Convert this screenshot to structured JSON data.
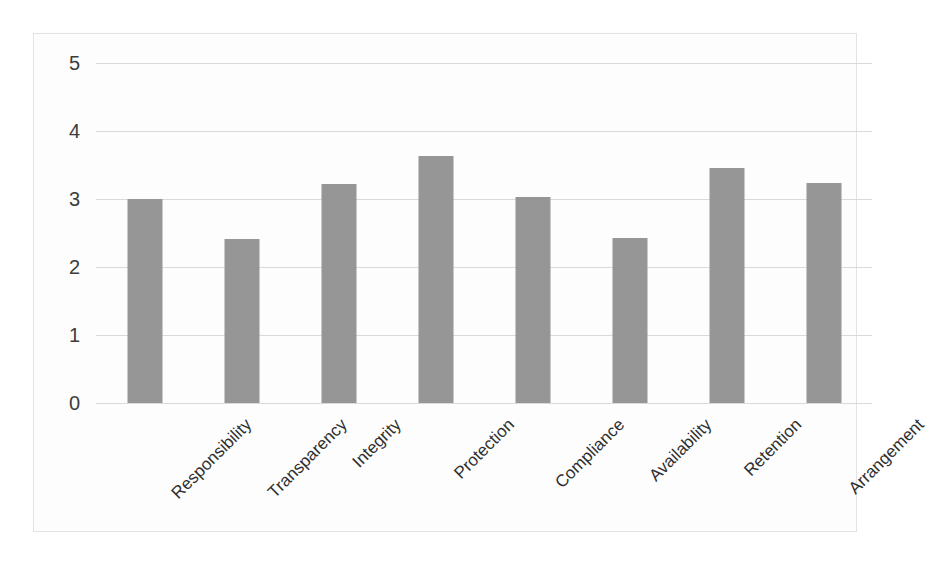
{
  "chart_data": {
    "type": "bar",
    "title": "",
    "subtitle": "",
    "xlabel": "",
    "ylabel": "",
    "categories": [
      "Responsibility",
      "Transparency",
      "Integrity",
      "Protection",
      "Compliance",
      "Availability",
      "Retention",
      "Arrangement"
    ],
    "values": [
      3.0,
      2.41,
      3.22,
      3.63,
      3.03,
      2.43,
      3.45,
      3.24
    ],
    "series": [
      {
        "name": "",
        "values": [
          3.0,
          2.41,
          3.22,
          3.63,
          3.03,
          2.43,
          3.45,
          3.24
        ]
      }
    ],
    "ylim": [
      0,
      5
    ],
    "ytick_labels": [
      "0",
      "1",
      "2",
      "3",
      "4",
      "5"
    ],
    "ytick_values": [
      0,
      1,
      2,
      3,
      4,
      5
    ],
    "xtick_label_rotation": -45,
    "grid": true,
    "grid_axis": "y",
    "legend": false,
    "legend_position": "none",
    "bar_color": "#969696",
    "gridline_color": "#dadada",
    "plot_background": "#fdfdfd",
    "frame_border_color": "#e3e3e3",
    "data_labels": false
  }
}
